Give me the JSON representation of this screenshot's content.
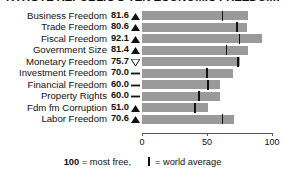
{
  "title": "KYRGYZ REPUBLIC'S TEN ECONOMIC FREEDOMS",
  "axis": {
    "ticks": [
      "0",
      "50",
      "100"
    ],
    "min": 0,
    "max": 100
  },
  "footer": {
    "most_free_number": "100",
    "most_free_text": "= most free,",
    "world_average_text": "= world average"
  },
  "chart_data": {
    "type": "bar",
    "title": "KYRGYZ REPUBLIC'S TEN ECONOMIC FREEDOMS",
    "orientation": "horizontal",
    "xlabel": "",
    "ylabel": "",
    "xlim": [
      0,
      100
    ],
    "grid": false,
    "legend": "100 = most free, | = world average",
    "categories": [
      "Business Freedom",
      "Trade Freedom",
      "Fiscal Freedom",
      "Government Size",
      "Monetary Freedom",
      "Investment Freedom",
      "Financial Freedom",
      "Property Rights",
      "Fdm fm Corruption",
      "Labor Freedom"
    ],
    "values": [
      81.6,
      80.6,
      92.1,
      81.4,
      75.7,
      70.0,
      60.0,
      60.0,
      51.0,
      70.6
    ],
    "value_labels": [
      "81.6",
      "80.6",
      "92.1",
      "81.4",
      "75.7",
      "70.0",
      "60.0",
      "60.0",
      "51.0",
      "70.6"
    ],
    "trend_indicators": [
      "up",
      "up",
      "up",
      "up",
      "down",
      "flat",
      "flat",
      "flat",
      "up",
      "up"
    ],
    "world_average": [
      62,
      73,
      75,
      65,
      74,
      50,
      51,
      44,
      41,
      62
    ],
    "series": [
      {
        "name": "Kyrgyz Republic score",
        "values": [
          81.6,
          80.6,
          92.1,
          81.4,
          75.7,
          70.0,
          60.0,
          60.0,
          51.0,
          70.6
        ],
        "color": "#9a9a9a"
      },
      {
        "name": "world average",
        "values": [
          62,
          73,
          75,
          65,
          74,
          50,
          51,
          44,
          41,
          62
        ],
        "color": "#111111",
        "marker": "vertical-tick"
      }
    ]
  },
  "colors": {
    "bar": "#9a9a9a",
    "marker": "#111111",
    "axis": "#555555",
    "text": "#111111"
  }
}
